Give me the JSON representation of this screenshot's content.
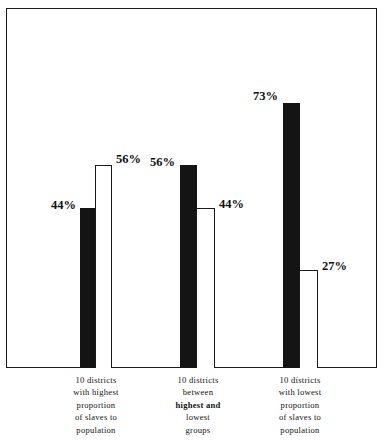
{
  "chart_data": {
    "type": "bar",
    "title": "",
    "subtitle": "",
    "xlabel": "",
    "ylabel": "",
    "ylim": [
      0,
      100
    ],
    "grid": false,
    "legend": "none",
    "value_suffix": "%",
    "categories": [
      "10 districts with highest proportion of slaves to population",
      "10 districts between highest and lowest groups",
      "10 districts with lowest proportion of slaves to population"
    ],
    "series": [
      {
        "name": "black-bar",
        "style": "filled",
        "values": [
          44,
          56,
          73
        ]
      },
      {
        "name": "white-bar",
        "style": "outlined",
        "values": [
          56,
          44,
          27
        ]
      }
    ],
    "bars": [
      {
        "group": 0,
        "series": 0,
        "value": 44,
        "label": "44%",
        "style": "filled",
        "label_side": "left"
      },
      {
        "group": 0,
        "series": 1,
        "value": 56,
        "label": "56%",
        "style": "outlined",
        "label_side": "right"
      },
      {
        "group": 1,
        "series": 0,
        "value": 56,
        "label": "56%",
        "style": "filled",
        "label_side": "left"
      },
      {
        "group": 1,
        "series": 1,
        "value": 44,
        "label": "44%",
        "style": "outlined",
        "label_side": "right"
      },
      {
        "group": 2,
        "series": 0,
        "value": 73,
        "label": "73%",
        "style": "filled",
        "label_side": "left"
      },
      {
        "group": 2,
        "series": 1,
        "value": 27,
        "label": "27%",
        "style": "outlined",
        "label_side": "right"
      }
    ]
  },
  "captions": {
    "group1": {
      "line1": "10 districts",
      "line2": "with highest",
      "line3": "proportion",
      "line4": "of slaves to",
      "line5": "population"
    },
    "group2": {
      "line1": "10 districts",
      "line2": "between",
      "line3": "highest and",
      "line4": "lowest",
      "line5": "groups"
    },
    "group3": {
      "line1": "10 districts",
      "line2": "with lowest",
      "line3": "proportion",
      "line4": "of slaves to",
      "line5": "population"
    }
  },
  "labels": {
    "g1b1": "44%",
    "g1b2": "56%",
    "g2b1": "56%",
    "g2b2": "44%",
    "g3b1": "73%",
    "g3b2": "27%"
  },
  "colors": {
    "bar_fill": "#141414",
    "bar_outline": "#1a1a1a",
    "frame": "#1a1a1a",
    "background": "#ffffff",
    "text": "#111111"
  }
}
